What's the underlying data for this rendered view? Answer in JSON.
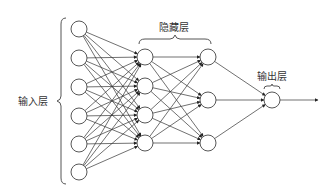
{
  "labels": {
    "input_layer": "输入层",
    "hidden_layer": "隐藏层",
    "output_layer": "输出层"
  },
  "layers": [
    {
      "name": "input",
      "x": 79,
      "ys": [
        29,
        58,
        87,
        116,
        144,
        172
      ]
    },
    {
      "name": "hidden1",
      "x": 145,
      "ys": [
        57,
        86,
        115,
        143
      ]
    },
    {
      "name": "hidden2",
      "x": 208,
      "ys": [
        57,
        100,
        143
      ]
    },
    {
      "name": "output",
      "x": 272,
      "ys": [
        100
      ]
    }
  ],
  "node_radius": 8,
  "output_arrow_end_x": 318,
  "colors": {
    "stroke": "#444444",
    "text": "#333333",
    "background": "#ffffff"
  }
}
